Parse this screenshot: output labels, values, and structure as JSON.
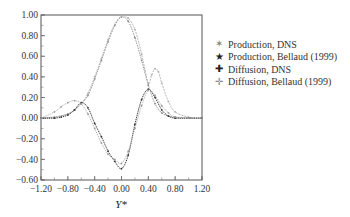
{
  "chart_data": {
    "type": "line",
    "title": "",
    "xlabel": "Y*",
    "ylabel": "",
    "xlim": [
      -1.2,
      1.2
    ],
    "ylim": [
      -0.6,
      1.0
    ],
    "grid": false,
    "legend_position": "right",
    "x_ticks": [
      "-1.20",
      "-0.80",
      "-0.40",
      "0.00",
      "0.40",
      "0.80",
      "1.20"
    ],
    "y_ticks": [
      "1.00",
      "0.80",
      "0.60",
      "0.40",
      "0.20",
      "0.00",
      "-0.20",
      "-0.40",
      "-0.60"
    ],
    "series": [
      {
        "name": "Production, DNS",
        "color": "#888888",
        "marker": "star",
        "x": [
          -1.2,
          -1.0,
          -0.8,
          -0.7,
          -0.6,
          -0.5,
          -0.4,
          -0.3,
          -0.2,
          -0.1,
          0.0,
          0.1,
          0.2,
          0.3,
          0.4,
          0.5,
          0.6,
          0.7,
          0.8,
          1.0,
          1.2
        ],
        "y": [
          0.0,
          0.01,
          0.04,
          0.08,
          0.14,
          0.22,
          0.38,
          0.56,
          0.74,
          0.9,
          0.98,
          0.94,
          0.78,
          0.56,
          0.32,
          0.14,
          0.05,
          0.02,
          0.01,
          0.0,
          0.0
        ]
      },
      {
        "name": "Production, Bellaud (1999)",
        "color": "#aaaaaa",
        "marker": "star-filled",
        "x": [
          -1.2,
          -1.0,
          -0.8,
          -0.7,
          -0.6,
          -0.5,
          -0.4,
          -0.3,
          -0.2,
          -0.1,
          0.0,
          0.1,
          0.2,
          0.3,
          0.4,
          0.45,
          0.5,
          0.55,
          0.6,
          0.7,
          0.8,
          1.0,
          1.2
        ],
        "y": [
          0.0,
          0.01,
          0.04,
          0.08,
          0.14,
          0.24,
          0.4,
          0.58,
          0.76,
          0.91,
          0.99,
          0.97,
          0.86,
          0.62,
          0.34,
          0.42,
          0.48,
          0.45,
          0.34,
          0.16,
          0.06,
          0.01,
          0.0
        ]
      },
      {
        "name": "Diffusion, DNS",
        "color": "#333333",
        "marker": "plus",
        "x": [
          -1.2,
          -1.0,
          -0.9,
          -0.8,
          -0.7,
          -0.6,
          -0.5,
          -0.4,
          -0.3,
          -0.2,
          -0.1,
          0.0,
          0.1,
          0.2,
          0.3,
          0.4,
          0.5,
          0.6,
          0.7,
          0.8,
          1.0,
          1.2
        ],
        "y": [
          0.0,
          0.0,
          0.01,
          0.03,
          0.08,
          0.15,
          0.1,
          -0.05,
          -0.18,
          -0.32,
          -0.42,
          -0.49,
          -0.36,
          -0.06,
          0.18,
          0.28,
          0.2,
          0.08,
          0.02,
          0.0,
          0.0,
          0.0
        ]
      },
      {
        "name": "Diffusion, Bellaud (1999)",
        "color": "#999999",
        "marker": "plus-light",
        "x": [
          -1.2,
          -1.0,
          -0.9,
          -0.8,
          -0.7,
          -0.6,
          -0.5,
          -0.4,
          -0.3,
          -0.2,
          -0.1,
          0.0,
          0.1,
          0.2,
          0.3,
          0.4,
          0.5,
          0.6,
          0.7,
          0.8,
          1.0,
          1.2
        ],
        "y": [
          0.0,
          0.06,
          0.11,
          0.15,
          0.17,
          0.14,
          0.04,
          -0.1,
          -0.24,
          -0.35,
          -0.4,
          -0.44,
          -0.32,
          -0.1,
          0.12,
          0.27,
          0.22,
          0.12,
          0.05,
          0.01,
          0.0,
          0.0
        ]
      }
    ]
  },
  "legend": {
    "items": [
      {
        "label": "Production, DNS",
        "marker": "✶",
        "color": "#888888"
      },
      {
        "label": "Production, Bellaud (1999)",
        "marker": "★",
        "color": "#222222"
      },
      {
        "label": "Diffusion, DNS",
        "marker": "✚",
        "color": "#222222"
      },
      {
        "label": "Diffusion, Bellaud (1999)",
        "marker": "✛",
        "color": "#888888"
      }
    ]
  }
}
